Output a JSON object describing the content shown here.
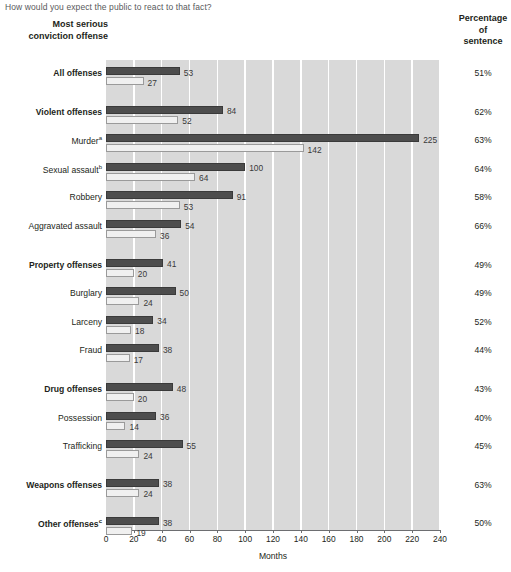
{
  "question": "How would you expect the public to react to that fact?",
  "headings": {
    "left": "Most serious\nconviction offense",
    "right": "Percentage\nof\nsentence"
  },
  "axis": {
    "title": "Months",
    "ticks": [
      "0",
      "20",
      "40",
      "60",
      "80",
      "100",
      "120",
      "140",
      "160",
      "180",
      "200",
      "220",
      "240"
    ],
    "min": 0,
    "max": 240
  },
  "colors": {
    "dark_bar": "#4d4d4d",
    "light_bar": "#f0f0f0",
    "plot_background": "#d9d9d9",
    "gridline": "#ffffff"
  },
  "chart_data": {
    "type": "bar",
    "xlabel": "Months",
    "ylabel": "",
    "xlim": [
      0,
      240
    ],
    "grid": true,
    "legend_position": "none",
    "orientation": "horizontal",
    "categories": [
      "All offenses",
      "Violent offenses",
      "Murder",
      "Sexual assault",
      "Robbery",
      "Aggravated assault",
      "Property offenses",
      "Burglary",
      "Larceny",
      "Fraud",
      "Drug offenses",
      "Possession",
      "Trafficking",
      "Weapons offenses",
      "Other offenses"
    ],
    "series": [
      {
        "name": "Sentence imposed",
        "values": [
          53,
          84,
          225,
          100,
          91,
          54,
          41,
          50,
          34,
          38,
          48,
          36,
          55,
          38,
          38
        ]
      },
      {
        "name": "Time served",
        "values": [
          27,
          52,
          142,
          64,
          53,
          36,
          20,
          24,
          18,
          17,
          20,
          14,
          24,
          24,
          19
        ]
      }
    ],
    "percentage_of_sentence": [
      "51%",
      "62%",
      "63%",
      "64%",
      "58%",
      "66%",
      "49%",
      "49%",
      "52%",
      "44%",
      "43%",
      "40%",
      "45%",
      "63%",
      "50%"
    ]
  },
  "rows": [
    {
      "label": "All offenses",
      "sup": "",
      "bold": true,
      "dark": 53,
      "light": 27,
      "pct": "51%",
      "group": 0
    },
    {
      "label": "Violent offenses",
      "sup": "",
      "bold": true,
      "dark": 84,
      "light": 52,
      "pct": "62%",
      "group": 1
    },
    {
      "label": "Murder",
      "sup": "a",
      "bold": false,
      "dark": 225,
      "light": 142,
      "pct": "63%",
      "group": 1
    },
    {
      "label": "Sexual assault",
      "sup": "b",
      "bold": false,
      "dark": 100,
      "light": 64,
      "pct": "64%",
      "group": 1
    },
    {
      "label": "Robbery",
      "sup": "",
      "bold": false,
      "dark": 91,
      "light": 53,
      "pct": "58%",
      "group": 1
    },
    {
      "label": "Aggravated assault",
      "sup": "",
      "bold": false,
      "dark": 54,
      "light": 36,
      "pct": "66%",
      "group": 1
    },
    {
      "label": "Property offenses",
      "sup": "",
      "bold": true,
      "dark": 41,
      "light": 20,
      "pct": "49%",
      "group": 2
    },
    {
      "label": "Burglary",
      "sup": "",
      "bold": false,
      "dark": 50,
      "light": 24,
      "pct": "49%",
      "group": 2
    },
    {
      "label": "Larceny",
      "sup": "",
      "bold": false,
      "dark": 34,
      "light": 18,
      "pct": "52%",
      "group": 2
    },
    {
      "label": "Fraud",
      "sup": "",
      "bold": false,
      "dark": 38,
      "light": 17,
      "pct": "44%",
      "group": 2
    },
    {
      "label": "Drug offenses",
      "sup": "",
      "bold": true,
      "dark": 48,
      "light": 20,
      "pct": "43%",
      "group": 3
    },
    {
      "label": "Possession",
      "sup": "",
      "bold": false,
      "dark": 36,
      "light": 14,
      "pct": "40%",
      "group": 3
    },
    {
      "label": "Trafficking",
      "sup": "",
      "bold": false,
      "dark": 55,
      "light": 24,
      "pct": "45%",
      "group": 3
    },
    {
      "label": "Weapons offenses",
      "sup": "",
      "bold": true,
      "dark": 38,
      "light": 24,
      "pct": "63%",
      "group": 4
    },
    {
      "label": "Other offenses",
      "sup": "c",
      "bold": true,
      "dark": 38,
      "light": 19,
      "pct": "50%",
      "group": 5
    }
  ]
}
